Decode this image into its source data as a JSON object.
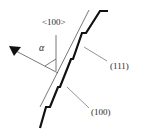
{
  "diagram": {
    "labels": {
      "direction": "<100>",
      "angle": "α",
      "step_facet": "(111)",
      "terrace_facet": "(100)"
    },
    "elements": {
      "surface_plane": "thin line representing macroscopic surface",
      "staircase": "thick stepped profile",
      "normal_arrow": "arrow with filled triangular head pointing upper-left",
      "direction_axis": "vertical line for <100>",
      "angle_arc": "arc between <100> axis and normal arrow"
    },
    "colors": {
      "stroke": "#1a1a1a",
      "thin_stroke": "#555555",
      "background": "#ffffff"
    }
  }
}
